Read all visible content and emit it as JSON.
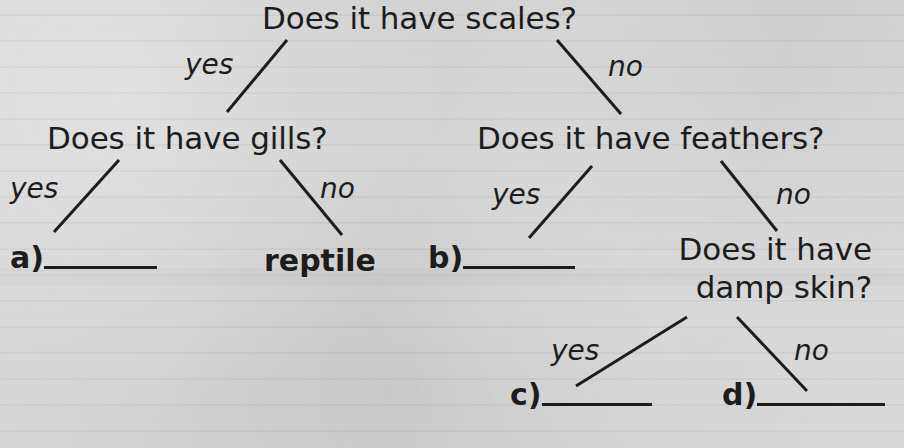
{
  "figure": {
    "kind": "decision-tree-worksheet",
    "background_color": "#d4d4d4",
    "ink_color": "#1d1d1d"
  },
  "tree": {
    "root": {
      "id": "scales",
      "text": "Does it have scales?",
      "yes_label": "yes",
      "no_label": "no"
    },
    "level2": {
      "left": {
        "id": "gills",
        "text": "Does it have gills?",
        "yes_label": "yes",
        "no_label": "no"
      },
      "right": {
        "id": "feathers",
        "text": "Does it have feathers?",
        "yes_label": "yes",
        "no_label": "no"
      }
    },
    "level3": {
      "damp_skin": {
        "id": "damp-skin",
        "line1": "Does it have",
        "line2": "damp skin?",
        "yes_label": "yes",
        "no_label": "no"
      }
    },
    "leaves": [
      {
        "id": "a",
        "marker": "a)",
        "answer": "",
        "filled": false
      },
      {
        "id": "reptile",
        "marker": "",
        "answer": "reptile",
        "filled": true
      },
      {
        "id": "b",
        "marker": "b)",
        "answer": "",
        "filled": false
      },
      {
        "id": "c",
        "marker": "c)",
        "answer": "",
        "filled": false
      },
      {
        "id": "d",
        "marker": "d)",
        "answer": "",
        "filled": false
      }
    ]
  }
}
